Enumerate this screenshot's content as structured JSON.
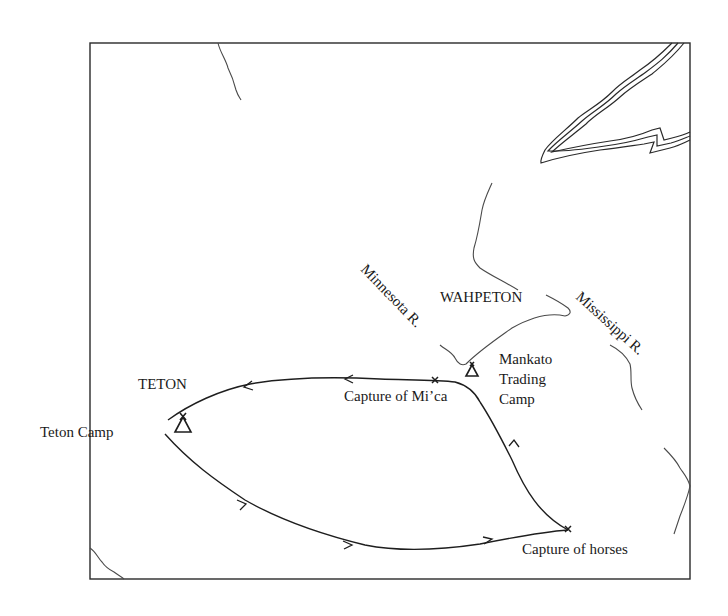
{
  "map": {
    "regions": [
      {
        "id": "teton",
        "label": "TETON"
      },
      {
        "id": "wahpeton",
        "label": "WAHPETON"
      }
    ],
    "rivers": [
      {
        "id": "minnesota",
        "label": "Minnesota R."
      },
      {
        "id": "mississippi",
        "label": "Mississippi R."
      }
    ],
    "places": [
      {
        "id": "teton-camp",
        "label": "Teton Camp",
        "symbol": "camp-tipi-icon"
      },
      {
        "id": "mankato",
        "label_lines": [
          "Mankato",
          "Trading",
          "Camp"
        ],
        "symbol": "camp-tipi-icon"
      },
      {
        "id": "capture-mica",
        "label": "Capture of Mi’ca",
        "symbol": "x-mark-icon"
      },
      {
        "id": "capture-horses",
        "label": "Capture of horses",
        "symbol": "x-mark-icon"
      }
    ],
    "route": {
      "description": "Loop: Teton Camp → Capture of horses → Mankato Trading Camp → Capture of Mi’ca → Teton Camp",
      "direction_markers": "arrowheads"
    },
    "colors": {
      "ink": "#1e1e1e",
      "background": "#ffffff"
    }
  }
}
